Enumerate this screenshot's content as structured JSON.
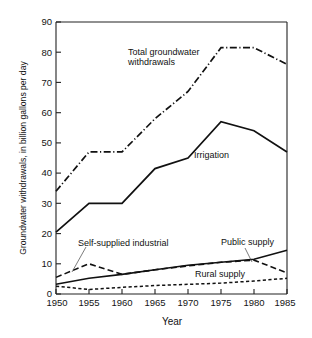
{
  "chart_data": {
    "type": "line",
    "title": "",
    "xlabel": "Year",
    "ylabel": "Groundwater withdrawals, in billion gallons per day",
    "x": [
      1950,
      1955,
      1960,
      1965,
      1970,
      1975,
      1980,
      1985
    ],
    "xlim": [
      1950,
      1985
    ],
    "ylim": [
      0,
      90
    ],
    "ytick_labels": [
      "0",
      "10",
      "20",
      "30",
      "40",
      "50",
      "60",
      "70",
      "80",
      "90"
    ],
    "yticks": [
      0,
      10,
      20,
      30,
      40,
      50,
      60,
      70,
      80,
      90
    ],
    "xtick_labels": [
      "1950",
      "1955",
      "1960",
      "1965",
      "1970",
      "1975",
      "1980",
      "1985"
    ],
    "grid": false,
    "legend_position": "inline-annotations",
    "series": [
      {
        "name": "Total groundwater withdrawals",
        "style": "dash-dot",
        "values": [
          34,
          47,
          47,
          58,
          67,
          81.5,
          81.5,
          76
        ]
      },
      {
        "name": "Irrigation",
        "style": "solid",
        "values": [
          20.5,
          30,
          30,
          41.5,
          45,
          57,
          54,
          47
        ]
      },
      {
        "name": "Public supply",
        "style": "solid",
        "values": [
          3.2,
          5.2,
          6.5,
          8,
          9.5,
          10.5,
          11.5,
          14.5
        ]
      },
      {
        "name": "Self-supplied industrial",
        "style": "long-dash",
        "values": [
          5.5,
          10,
          6.5,
          8,
          9.3,
          10.5,
          11.2,
          7
        ]
      },
      {
        "name": "Rural supply",
        "style": "short-dash",
        "values": [
          2.6,
          1.5,
          2.2,
          2.8,
          3.2,
          3.6,
          4.3,
          5.2
        ]
      }
    ],
    "annotations": [
      {
        "text_line1": "Total groundwater",
        "text_line2": "withdrawals",
        "name": "total-groundwater-withdrawals-label"
      },
      {
        "text_line1": "Irrigation",
        "text_line2": "",
        "name": "irrigation-label"
      },
      {
        "text_line1": "Self-supplied industrial",
        "text_line2": "",
        "name": "self-supplied-industrial-label"
      },
      {
        "text_line1": "Public supply",
        "text_line2": "",
        "name": "public-supply-label"
      },
      {
        "text_line1": "Rural supply",
        "text_line2": "",
        "name": "rural-supply-label"
      }
    ]
  }
}
